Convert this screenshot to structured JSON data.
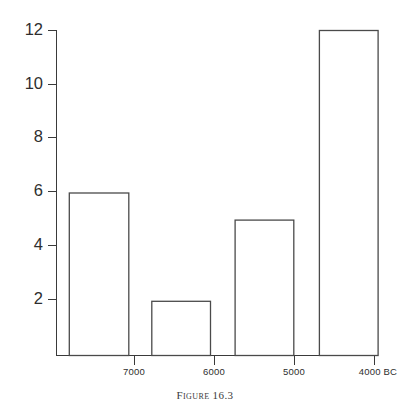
{
  "figure": {
    "caption": "Figure 16.3"
  },
  "chart_data": {
    "type": "bar",
    "title": "",
    "xlabel": "",
    "ylabel": "",
    "categories": [
      "7500-7000 BC",
      "7000-6500 BC",
      "6000-5500 BC",
      "5000-4500 BC"
    ],
    "values": [
      6,
      2,
      5,
      12
    ],
    "bars": [
      {
        "label": "7500-7000 BC",
        "value": 6,
        "x_start": 7600,
        "x_end": 6900
      },
      {
        "label": "7000-6500 BC",
        "value": 2,
        "x_start": 6630,
        "x_end": 5940
      },
      {
        "label": "6000-5500 BC",
        "value": 5,
        "x_start": 5650,
        "x_end": 4960
      },
      {
        "label": "5000-4500 BC",
        "value": 12,
        "x_start": 4660,
        "x_end": 3970
      }
    ],
    "ylim": [
      0,
      12
    ],
    "y_ticks": [
      2,
      4,
      6,
      8,
      10,
      12
    ],
    "y_tick_labels": [
      "2",
      "4",
      "6",
      "8",
      "10",
      "12"
    ],
    "xlim": [
      7750,
      4000
    ],
    "x_ticks": [
      7000,
      6000,
      5000,
      4000
    ],
    "x_tick_labels": [
      "7000",
      "6000",
      "5000",
      "4000 BC"
    ],
    "grid": false,
    "legend": null,
    "colors": {
      "bar_fill": "#ffffff",
      "bar_stroke": "#4a4a4a",
      "axis": "#3a3a3a",
      "text": "#2e2e2e",
      "background": "#ffffff"
    }
  }
}
